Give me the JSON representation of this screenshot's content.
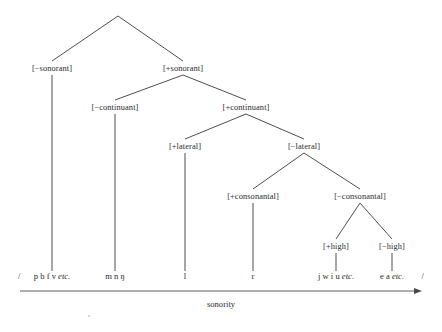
{
  "figure": {
    "background_color": "#ffffff",
    "line_color": "#3a3a3a",
    "text_color": "#2b2b2b"
  },
  "axis": {
    "caption": "sonority",
    "direction": "left-to-right",
    "arrow_head": "right",
    "x_start": 20,
    "x_end": 422,
    "y": 291
  },
  "delimiters": {
    "open": "/",
    "close": "/"
  },
  "nodes": {
    "root": {
      "label": "",
      "x": 118,
      "y": 16
    },
    "minus_sonorant": {
      "label": "[−sonorant]",
      "x": 52,
      "y": 68
    },
    "plus_sonorant": {
      "label": "[+sonorant]",
      "x": 183,
      "y": 68
    },
    "minus_continuant": {
      "label": "[−continuant]",
      "x": 115,
      "y": 107
    },
    "plus_continuant": {
      "label": "[+continuant]",
      "x": 246,
      "y": 107
    },
    "plus_lateral": {
      "label": "[+lateral]",
      "x": 185,
      "y": 146
    },
    "minus_lateral": {
      "label": "[−lateral]",
      "x": 304,
      "y": 146
    },
    "plus_consonantal": {
      "label": "[+consonantal]",
      "x": 253,
      "y": 196
    },
    "minus_consonantal": {
      "label": "[−consonantal]",
      "x": 360,
      "y": 196
    },
    "plus_high": {
      "label": "[+high]",
      "x": 336,
      "y": 246
    },
    "minus_high": {
      "label": "[−high]",
      "x": 392,
      "y": 246
    }
  },
  "leaves": [
    {
      "name": "obstruents",
      "x": 52,
      "y": 279,
      "stem_from": 75,
      "stem_to": 272,
      "segments": "p b f v",
      "etc": "etc.",
      "display": "p b f v etc."
    },
    {
      "name": "nasals",
      "x": 115,
      "y": 279,
      "stem_from": 114,
      "stem_to": 272,
      "segments": "m n ŋ",
      "etc": "",
      "display": "m n ŋ"
    },
    {
      "name": "lateral",
      "x": 185,
      "y": 279,
      "stem_from": 153,
      "stem_to": 272,
      "segments": "l",
      "etc": "",
      "display": "l"
    },
    {
      "name": "rhotic",
      "x": 253,
      "y": 279,
      "stem_from": 203,
      "stem_to": 272,
      "segments": "r",
      "etc": "",
      "display": "r"
    },
    {
      "name": "high-vocoids",
      "x": 336,
      "y": 279,
      "stem_from": 253,
      "stem_to": 272,
      "segments": "j w i u",
      "etc": "etc.",
      "display": "j w i u etc."
    },
    {
      "name": "nonhigh-vowels",
      "x": 392,
      "y": 279,
      "stem_from": 253,
      "stem_to": 272,
      "segments": "e a",
      "etc": "etc.",
      "display": "e a etc."
    }
  ],
  "edges": [
    {
      "from": "root",
      "to": "minus_sonorant"
    },
    {
      "from": "root",
      "to": "plus_sonorant"
    },
    {
      "from": "plus_sonorant",
      "to": "minus_continuant"
    },
    {
      "from": "plus_sonorant",
      "to": "plus_continuant"
    },
    {
      "from": "plus_continuant",
      "to": "plus_lateral"
    },
    {
      "from": "plus_continuant",
      "to": "minus_lateral"
    },
    {
      "from": "minus_lateral",
      "to": "plus_consonantal"
    },
    {
      "from": "minus_lateral",
      "to": "minus_consonantal"
    },
    {
      "from": "minus_consonantal",
      "to": "plus_high"
    },
    {
      "from": "minus_consonantal",
      "to": "minus_high"
    }
  ]
}
